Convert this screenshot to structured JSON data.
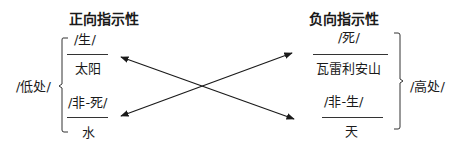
{
  "diagram": {
    "left": {
      "heading": "正向指示性",
      "group_label": "/低处/",
      "items": [
        {
          "signifier": "/生/",
          "signified": "太阳"
        },
        {
          "signifier": "/非-死/",
          "signified": "水"
        }
      ]
    },
    "right": {
      "heading": "负向指示性",
      "group_label": "/高处/",
      "items": [
        {
          "signifier": "/死/",
          "signified": "瓦雷利安山"
        },
        {
          "signifier": "/非-生/",
          "signified": "天"
        }
      ]
    },
    "arrows": [
      {
        "from": "天",
        "to": "太阳",
        "direction": "bidirectional"
      },
      {
        "from": "水",
        "to": "瓦雷利安山",
        "direction": "bidirectional"
      }
    ],
    "colors": {
      "ink": "#1a1a1a",
      "background": "#ffffff"
    }
  }
}
